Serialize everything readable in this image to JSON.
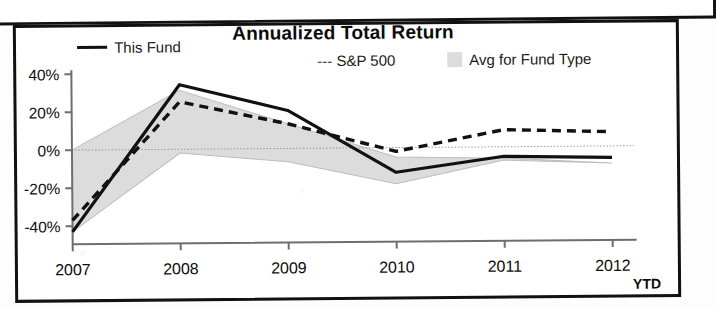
{
  "chart_data": {
    "type": "line",
    "title": "Annualized Total Return",
    "xlabel": "",
    "ylabel": "",
    "categories": [
      "2007",
      "2008",
      "2009",
      "2010",
      "2011",
      "2012"
    ],
    "x_axis_suffix": "YTD",
    "ytick_labels": [
      "40%",
      "20%",
      "0%",
      "-20%",
      "-40%"
    ],
    "ytick_values": [
      40,
      20,
      0,
      -20,
      -40
    ],
    "ylim": [
      -48,
      42
    ],
    "grid": "zero-line-only",
    "legend_position": "top",
    "series": [
      {
        "name": "This Fund",
        "style": "solid",
        "color": "#111111",
        "values": [
          -43,
          34,
          20,
          -13,
          -5,
          -6
        ]
      },
      {
        "name": "S&P 500",
        "style": "dashed",
        "color": "#111111",
        "values": [
          -37,
          25,
          13,
          -2,
          9,
          7.5
        ]
      },
      {
        "name": "Avg for Fund Type",
        "style": "band",
        "color": "#dcdcdc",
        "upper_values": [
          0,
          31,
          13,
          -5,
          -6,
          -9
        ],
        "lower_values": [
          -43,
          -2,
          -7,
          -19,
          -7,
          -9
        ]
      }
    ]
  },
  "legend": {
    "this_fund": "This Fund",
    "sp500": "--- S&P 500",
    "avg_fund_type": "Avg for Fund Type"
  },
  "axis": {
    "ytick_0": "40%",
    "ytick_1": "20%",
    "ytick_2": "0%",
    "ytick_3": "-20%",
    "ytick_4": "-40%",
    "xtick_0": "2007",
    "xtick_1": "2008",
    "xtick_2": "2009",
    "xtick_3": "2010",
    "xtick_4": "2011",
    "xtick_5": "2012",
    "ytd": "YTD"
  }
}
